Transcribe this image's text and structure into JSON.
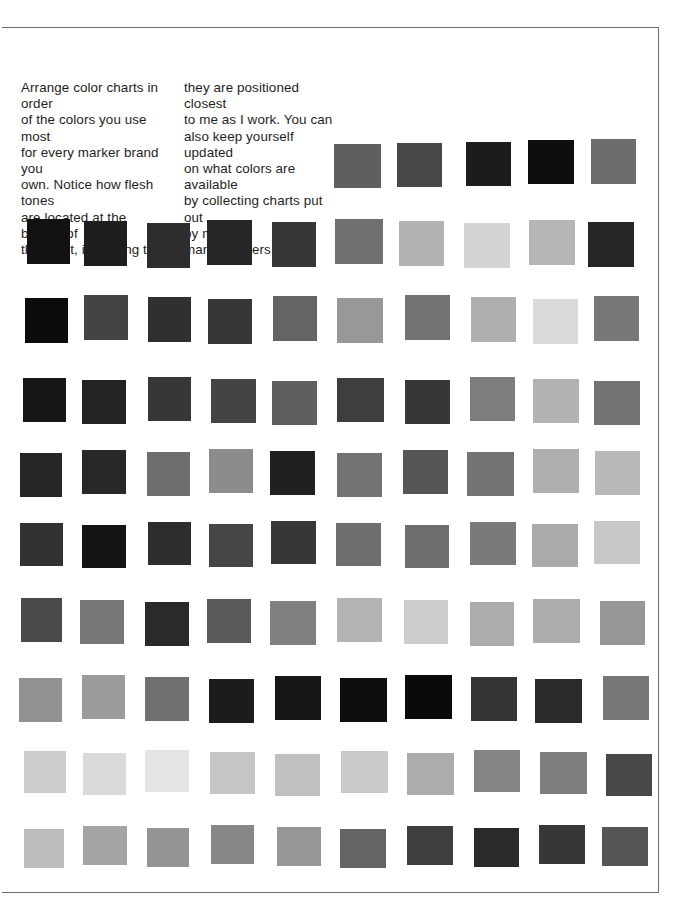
{
  "page": {
    "caption_left": "Arrange color charts in order\nof the colors you use most\nfor every marker brand you\nown. Notice how flesh tones\nare located at the bottom of\nthe chart, indicating that",
    "caption_right": "they are positioned closest\nto me as I work. You can\nalso keep yourself updated\non what colors are available\nby collecting charts put out\nby marker manufacturers.",
    "frame_color": "#6e6e6e"
  },
  "swatch_chart": {
    "top_row": [
      {
        "x": 334,
        "y": 144,
        "w": 47,
        "h": 44,
        "gray": 95
      },
      {
        "x": 397,
        "y": 143,
        "w": 45,
        "h": 44,
        "gray": 72
      },
      {
        "x": 466,
        "y": 142,
        "w": 45,
        "h": 44,
        "gray": 28
      },
      {
        "x": 528,
        "y": 140,
        "w": 46,
        "h": 44,
        "gray": 14
      },
      {
        "x": 591,
        "y": 139,
        "w": 45,
        "h": 45,
        "gray": 108
      }
    ],
    "rows": [
      {
        "y": 221,
        "h": 45,
        "cells": [
          {
            "x": 27,
            "w": 43,
            "gray": 18
          },
          {
            "x": 84,
            "w": 43,
            "gray": 30
          },
          {
            "x": 147,
            "w": 43,
            "gray": 45
          },
          {
            "x": 207,
            "w": 45,
            "gray": 38
          },
          {
            "x": 272,
            "w": 44,
            "gray": 55
          },
          {
            "x": 335,
            "w": 48,
            "gray": 112
          },
          {
            "x": 399,
            "w": 45,
            "gray": 178
          },
          {
            "x": 464,
            "w": 46,
            "gray": 212
          },
          {
            "x": 529,
            "w": 46,
            "gray": 182
          },
          {
            "x": 588,
            "w": 46,
            "gray": 38
          }
        ]
      },
      {
        "y": 297,
        "h": 45,
        "cells": [
          {
            "x": 25,
            "w": 43,
            "gray": 12
          },
          {
            "x": 84,
            "w": 44,
            "gray": 68
          },
          {
            "x": 148,
            "w": 43,
            "gray": 48
          },
          {
            "x": 208,
            "w": 44,
            "gray": 55
          },
          {
            "x": 273,
            "w": 44,
            "gray": 100
          },
          {
            "x": 337,
            "w": 46,
            "gray": 152
          },
          {
            "x": 405,
            "w": 45,
            "gray": 115
          },
          {
            "x": 471,
            "w": 45,
            "gray": 175
          },
          {
            "x": 533,
            "w": 45,
            "gray": 218
          },
          {
            "x": 594,
            "w": 45,
            "gray": 120
          }
        ]
      },
      {
        "y": 379,
        "h": 44,
        "cells": [
          {
            "x": 23,
            "w": 43,
            "gray": 22
          },
          {
            "x": 82,
            "w": 44,
            "gray": 35
          },
          {
            "x": 148,
            "w": 43,
            "gray": 55
          },
          {
            "x": 211,
            "w": 45,
            "gray": 68
          },
          {
            "x": 272,
            "w": 45,
            "gray": 95
          },
          {
            "x": 337,
            "w": 47,
            "gray": 62
          },
          {
            "x": 405,
            "w": 45,
            "gray": 55
          },
          {
            "x": 470,
            "w": 45,
            "gray": 125
          },
          {
            "x": 533,
            "w": 46,
            "gray": 178
          },
          {
            "x": 594,
            "w": 46,
            "gray": 115
          }
        ]
      },
      {
        "y": 451,
        "h": 44,
        "cells": [
          {
            "x": 20,
            "w": 42,
            "gray": 38
          },
          {
            "x": 82,
            "w": 44,
            "gray": 40
          },
          {
            "x": 147,
            "w": 43,
            "gray": 110
          },
          {
            "x": 209,
            "w": 44,
            "gray": 140
          },
          {
            "x": 270,
            "w": 45,
            "gray": 32
          },
          {
            "x": 337,
            "w": 45,
            "gray": 115
          },
          {
            "x": 403,
            "w": 45,
            "gray": 85
          },
          {
            "x": 467,
            "w": 47,
            "gray": 115
          },
          {
            "x": 533,
            "w": 46,
            "gray": 175
          },
          {
            "x": 595,
            "w": 45,
            "gray": 185
          }
        ]
      },
      {
        "y": 523,
        "h": 43,
        "cells": [
          {
            "x": 20,
            "w": 43,
            "gray": 50
          },
          {
            "x": 82,
            "w": 44,
            "gray": 20
          },
          {
            "x": 148,
            "w": 43,
            "gray": 45
          },
          {
            "x": 209,
            "w": 44,
            "gray": 70
          },
          {
            "x": 271,
            "w": 45,
            "gray": 55
          },
          {
            "x": 336,
            "w": 45,
            "gray": 110
          },
          {
            "x": 405,
            "w": 44,
            "gray": 110
          },
          {
            "x": 470,
            "w": 46,
            "gray": 122
          },
          {
            "x": 532,
            "w": 46,
            "gray": 170
          },
          {
            "x": 594,
            "w": 46,
            "gray": 200
          }
        ]
      },
      {
        "y": 600,
        "h": 44,
        "cells": [
          {
            "x": 21,
            "w": 41,
            "gray": 75
          },
          {
            "x": 80,
            "w": 44,
            "gray": 118
          },
          {
            "x": 145,
            "w": 44,
            "gray": 42
          },
          {
            "x": 207,
            "w": 44,
            "gray": 90
          },
          {
            "x": 270,
            "w": 46,
            "gray": 128
          },
          {
            "x": 337,
            "w": 45,
            "gray": 180
          },
          {
            "x": 404,
            "w": 44,
            "gray": 205
          },
          {
            "x": 470,
            "w": 44,
            "gray": 172
          },
          {
            "x": 533,
            "w": 47,
            "gray": 172
          },
          {
            "x": 600,
            "w": 45,
            "gray": 150
          }
        ]
      },
      {
        "y": 677,
        "h": 44,
        "cells": [
          {
            "x": 19,
            "w": 43,
            "gray": 145
          },
          {
            "x": 82,
            "w": 43,
            "gray": 155
          },
          {
            "x": 145,
            "w": 44,
            "gray": 112
          },
          {
            "x": 209,
            "w": 45,
            "gray": 28
          },
          {
            "x": 275,
            "w": 46,
            "gray": 22
          },
          {
            "x": 340,
            "w": 47,
            "gray": 14
          },
          {
            "x": 405,
            "w": 47,
            "gray": 10
          },
          {
            "x": 471,
            "w": 46,
            "gray": 52
          },
          {
            "x": 535,
            "w": 47,
            "gray": 42
          },
          {
            "x": 603,
            "w": 46,
            "gray": 120
          }
        ]
      },
      {
        "y": 752,
        "h": 42,
        "cells": [
          {
            "x": 24,
            "w": 42,
            "gray": 205
          },
          {
            "x": 83,
            "w": 43,
            "gray": 218
          },
          {
            "x": 145,
            "w": 44,
            "gray": 228
          },
          {
            "x": 210,
            "w": 45,
            "gray": 198
          },
          {
            "x": 275,
            "w": 45,
            "gray": 192
          },
          {
            "x": 341,
            "w": 47,
            "gray": 202
          },
          {
            "x": 407,
            "w": 47,
            "gray": 172
          },
          {
            "x": 474,
            "w": 46,
            "gray": 132
          },
          {
            "x": 540,
            "w": 47,
            "gray": 126
          },
          {
            "x": 606,
            "w": 46,
            "gray": 72
          }
        ]
      },
      {
        "y": 827,
        "h": 39,
        "cells": [
          {
            "x": 24,
            "w": 40,
            "gray": 188
          },
          {
            "x": 83,
            "w": 44,
            "gray": 165
          },
          {
            "x": 147,
            "w": 42,
            "gray": 148
          },
          {
            "x": 211,
            "w": 43,
            "gray": 135
          },
          {
            "x": 277,
            "w": 44,
            "gray": 150
          },
          {
            "x": 340,
            "w": 46,
            "gray": 100
          },
          {
            "x": 407,
            "w": 46,
            "gray": 62
          },
          {
            "x": 474,
            "w": 45,
            "gray": 42
          },
          {
            "x": 539,
            "w": 46,
            "gray": 55
          },
          {
            "x": 602,
            "w": 46,
            "gray": 85
          }
        ]
      }
    ]
  }
}
